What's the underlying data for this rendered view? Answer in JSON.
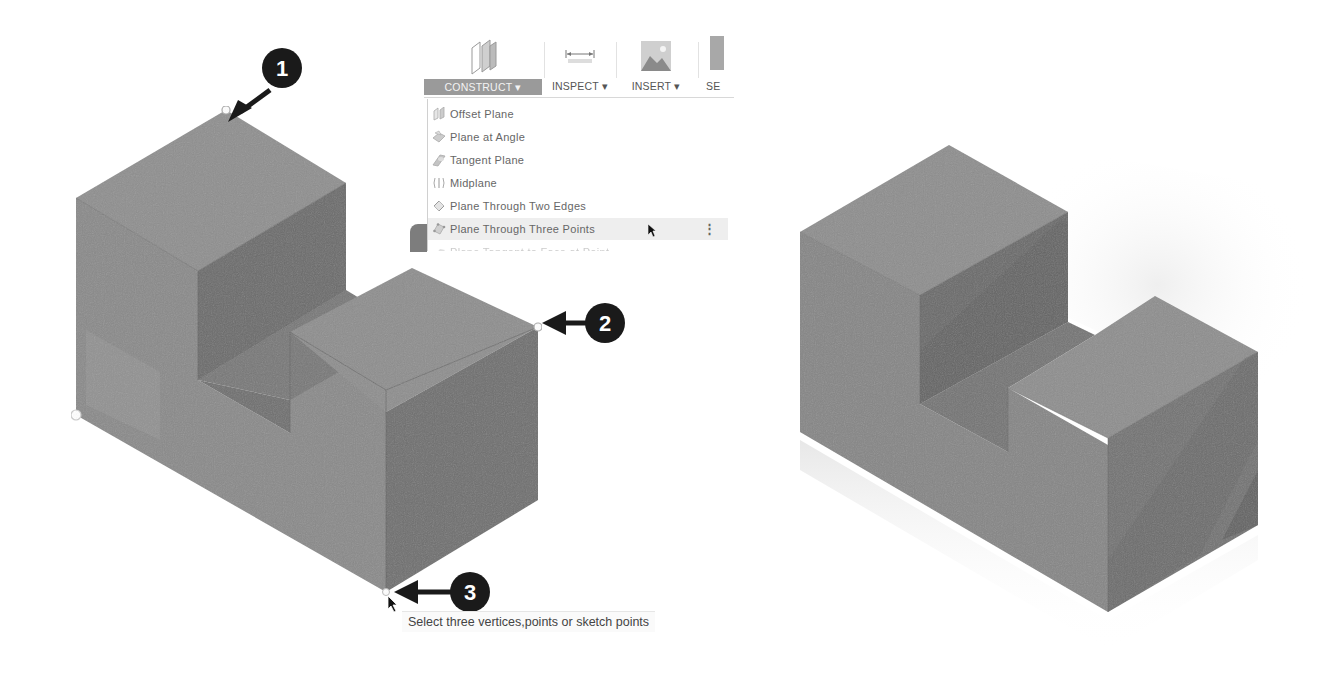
{
  "toolbar": {
    "tools": [
      {
        "label": "CONSTRUCT ▾",
        "icon": "construct-planes-icon",
        "active": true
      },
      {
        "label": "INSPECT ▾",
        "icon": "measure-icon",
        "active": false
      },
      {
        "label": "INSERT ▾",
        "icon": "insert-image-icon",
        "active": false
      },
      {
        "label": "SE",
        "icon": "select-icon",
        "active": false
      }
    ]
  },
  "construct_menu": {
    "items": [
      {
        "label": "Offset Plane",
        "icon": "offset-plane-icon"
      },
      {
        "label": "Plane at Angle",
        "icon": "plane-at-angle-icon"
      },
      {
        "label": "Tangent Plane",
        "icon": "tangent-plane-icon"
      },
      {
        "label": "Midplane",
        "icon": "midplane-icon"
      },
      {
        "label": "Plane Through Two Edges",
        "icon": "plane-two-edges-icon"
      },
      {
        "label": "Plane Through Three Points",
        "icon": "plane-three-points-icon",
        "highlighted": true,
        "more": "⋮"
      },
      {
        "label": "Plane Tangent to Face at Point",
        "icon": "plane-tangent-face-icon",
        "cut_off": true
      }
    ]
  },
  "callouts": [
    {
      "number": "1",
      "target": "top vertex of tall block"
    },
    {
      "number": "2",
      "target": "right vertex of short block"
    },
    {
      "number": "3",
      "target": "bottom front vertex"
    }
  ],
  "status": {
    "tooltip": "Select three vertices,points or sketch points"
  },
  "colors": {
    "top_face": "#8f8f8f",
    "left_face": "#878787",
    "right_face": "#6f6f6f",
    "notch_wall": "#6a6a6a",
    "menu_active_bg": "#9a9a9a",
    "callout_bg": "#1a1a1a"
  }
}
